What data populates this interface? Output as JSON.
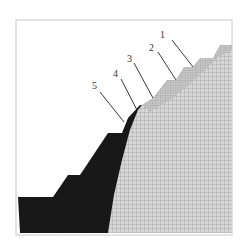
{
  "figure": {
    "colors": {
      "frame": "#c8c8c8",
      "dark_region": "#151515",
      "mesh_region": "#d4d4d4",
      "mesh_lines": "#8a8a8a",
      "leader_lines": "#222222",
      "label_text": "#333333"
    },
    "labels": [
      {
        "id": "1",
        "text": "1"
      },
      {
        "id": "2",
        "text": "2"
      },
      {
        "id": "3",
        "text": "3"
      },
      {
        "id": "4",
        "text": "4"
      },
      {
        "id": "5",
        "text": "5"
      }
    ]
  }
}
